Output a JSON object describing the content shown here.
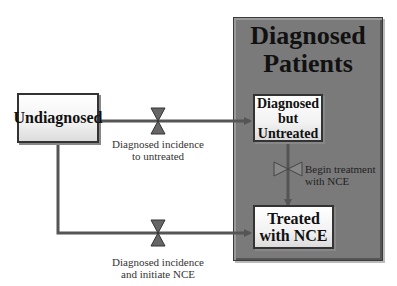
{
  "diagram": {
    "container": {
      "title_line1": "Diagnosed",
      "title_line2": "Patients"
    },
    "stocks": {
      "undiagnosed": "Undiagnosed",
      "untreated_line1": "Diagnosed",
      "untreated_line2": "but",
      "untreated_line3": "Untreated",
      "treated_line1": "Treated",
      "treated_line2": "with NCE"
    },
    "flows": {
      "to_untreated_line1": "Diagnosed incidence",
      "to_untreated_line2": "to untreated",
      "begin_treatment_line1": "Begin treatment",
      "begin_treatment_line2": "with NCE",
      "initiate_line1": "Diagnosed incidence",
      "initiate_line2": "and initiate NCE"
    },
    "colors": {
      "container": "#7a7a7a",
      "flow_pipe": "#555555",
      "stock_fill": "#f4f4f4"
    }
  }
}
